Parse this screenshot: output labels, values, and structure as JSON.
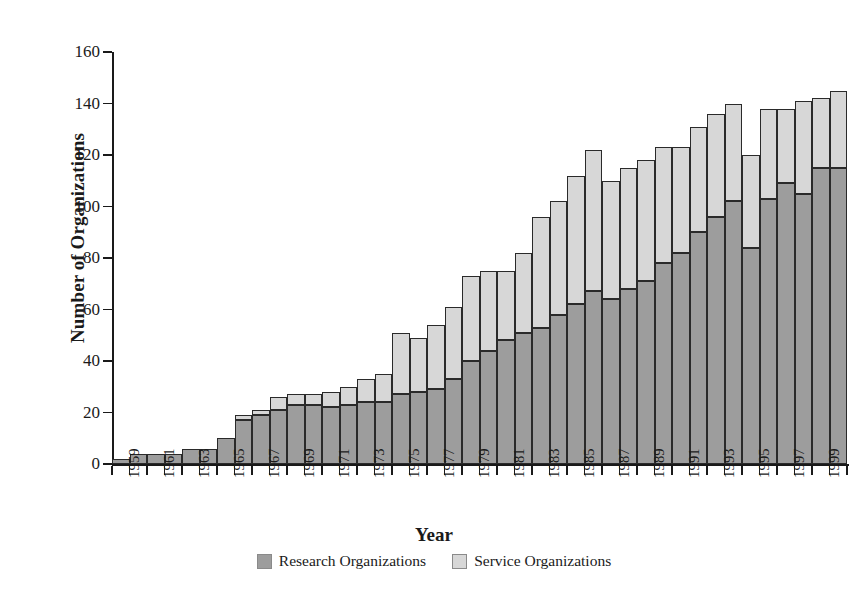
{
  "chart_data": {
    "type": "bar",
    "subtype": "stacked-vertical",
    "title": "",
    "xlabel": "Year",
    "ylabel": "Number of Organizations",
    "ylim": [
      0,
      160
    ],
    "ytick_step": 20,
    "yticks": [
      0,
      20,
      40,
      60,
      80,
      100,
      120,
      140,
      160
    ],
    "grid": false,
    "legend_position": "bottom-center",
    "categories": [
      "1959",
      "1960",
      "1961",
      "1962",
      "1963",
      "1964",
      "1965",
      "1966",
      "1967",
      "1968",
      "1969",
      "1970",
      "1971",
      "1972",
      "1973",
      "1974",
      "1975",
      "1976",
      "1977",
      "1978",
      "1979",
      "1980",
      "1981",
      "1982",
      "1983",
      "1984",
      "1985",
      "1986",
      "1987",
      "1988",
      "1989",
      "1990",
      "1991",
      "1992",
      "1993",
      "1994",
      "1995",
      "1996",
      "1997",
      "1998",
      "1999",
      "2000"
    ],
    "xtick_labels_shown": [
      "1959",
      "1961",
      "1963",
      "1965",
      "1967",
      "1969",
      "1971",
      "1973",
      "1975",
      "1977",
      "1979",
      "1981",
      "1983",
      "1985",
      "1987",
      "1989",
      "1991",
      "1993",
      "1995",
      "1997",
      "1999"
    ],
    "series": [
      {
        "name": "Research Organizations",
        "color": "#9d9d9d",
        "values": [
          2,
          4,
          4,
          4,
          6,
          6,
          10,
          17,
          19,
          21,
          23,
          23,
          22,
          23,
          24,
          24,
          27,
          28,
          29,
          33,
          40,
          44,
          48,
          51,
          53,
          58,
          62,
          67,
          64,
          68,
          71,
          78,
          82,
          90,
          96,
          102,
          84,
          103,
          109,
          105,
          115,
          115
        ]
      },
      {
        "name": "Service Organizations",
        "color": "#d7d7d7",
        "values": [
          0,
          0,
          0,
          0,
          0,
          0,
          0,
          2,
          2,
          5,
          4,
          4,
          6,
          7,
          9,
          11,
          24,
          21,
          25,
          28,
          33,
          31,
          27,
          31,
          43,
          44,
          50,
          55,
          46,
          47,
          47,
          45,
          41,
          41,
          40,
          38,
          36,
          35,
          29,
          36,
          27,
          30
        ]
      }
    ],
    "totals": [
      2,
      4,
      4,
      4,
      6,
      6,
      10,
      19,
      21,
      26,
      27,
      27,
      28,
      30,
      33,
      35,
      51,
      49,
      54,
      61,
      73,
      75,
      75,
      82,
      96,
      102,
      112,
      122,
      110,
      115,
      118,
      123,
      123,
      131,
      136,
      140,
      120,
      138,
      138,
      141,
      142,
      145
    ]
  },
  "legend": {
    "items": [
      {
        "label": "Research Organizations",
        "color": "#9d9d9d",
        "swatch": "research-swatch"
      },
      {
        "label": "Service Organizations",
        "color": "#d7d7d7",
        "swatch": "service-swatch"
      }
    ]
  }
}
